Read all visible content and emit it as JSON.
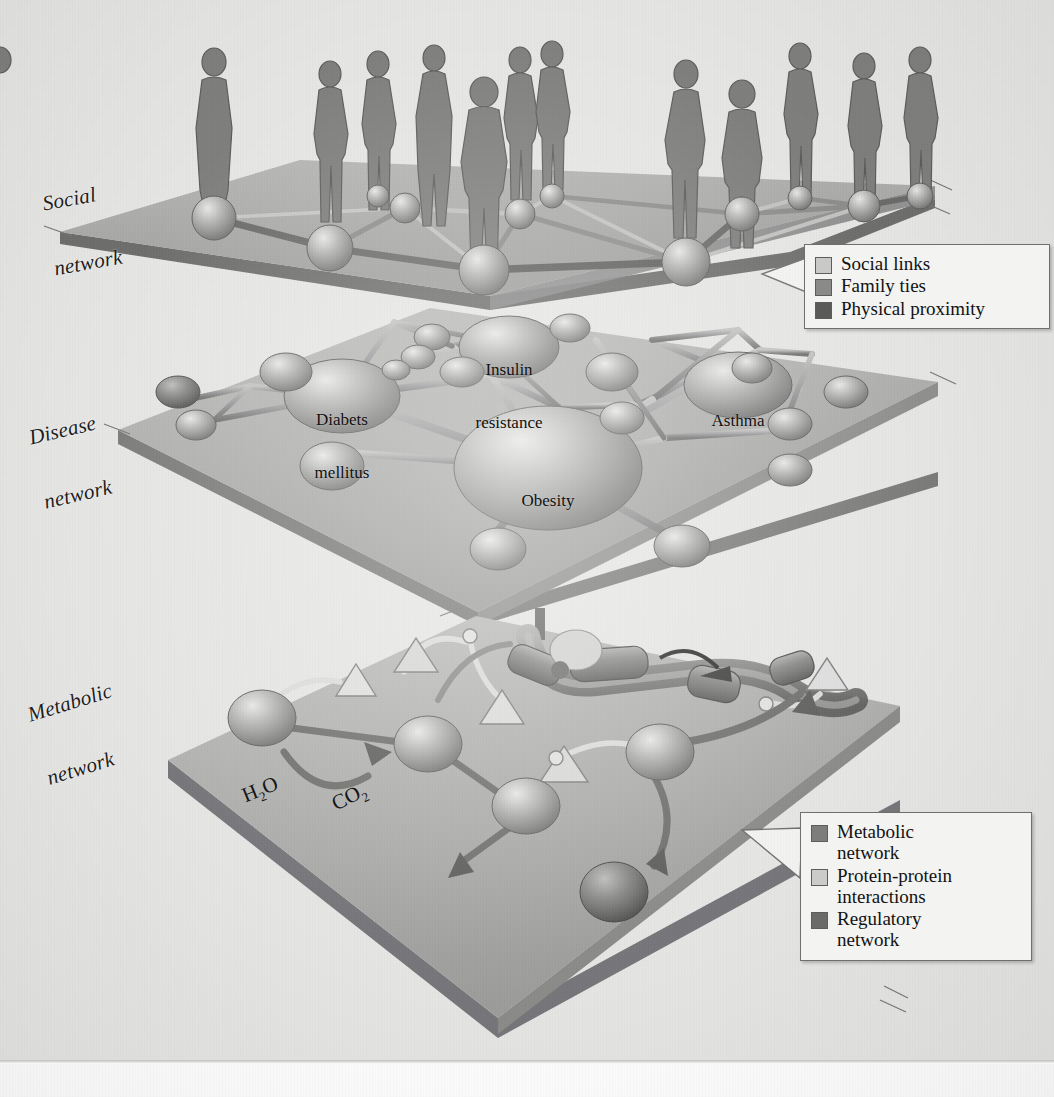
{
  "figure": {
    "background_color": "#e6e6e4",
    "ink_color": "#1d1d1d"
  },
  "layers": [
    {
      "id": "social",
      "label_line1": "Social",
      "label_line2": "network",
      "plane_color": "#9a9a98",
      "person_count": 12,
      "node_count": 12
    },
    {
      "id": "disease",
      "label_line1": "Disease",
      "label_line2": "network",
      "plane_color": "#a8a8a6",
      "node_count": 21
    },
    {
      "id": "metabolic",
      "label_line1": "Metabolic",
      "label_line2": "network",
      "plane_color": "#a3a3a1",
      "node_count": 5
    }
  ],
  "disease_nodes": [
    {
      "label_line1": "Insulin",
      "label_line2": "resistance",
      "size": "large"
    },
    {
      "label_line1": "Diabets",
      "label_line2": "mellitus",
      "size": "large"
    },
    {
      "label_line1": "Asthma",
      "label_line2": "",
      "size": "large"
    },
    {
      "label_line1": "Obesity",
      "label_line2": "",
      "size": "hub"
    }
  ],
  "metabolic_labels": [
    {
      "formula": "H",
      "sub": "2",
      "tail": "O"
    },
    {
      "formula": "CO",
      "sub": "2",
      "tail": ""
    }
  ],
  "legends": [
    {
      "id": "social-legend",
      "items": [
        {
          "label_line1": "Social links",
          "label_line2": "",
          "color": "#c9c9c7"
        },
        {
          "label_line1": "Family ties",
          "label_line2": "",
          "color": "#8a8a88"
        },
        {
          "label_line1": "Physical proximity",
          "label_line2": "",
          "color": "#5a5a58"
        }
      ]
    },
    {
      "id": "molecular-legend",
      "items": [
        {
          "label_line1": "Metabolic",
          "label_line2": "network",
          "color": "#7d7d7b"
        },
        {
          "label_line1": "Protein-protein",
          "label_line2": "interactions",
          "color": "#cbcbc9"
        },
        {
          "label_line1": "Regulatory",
          "label_line2": "network",
          "color": "#6a6a68"
        }
      ]
    }
  ]
}
